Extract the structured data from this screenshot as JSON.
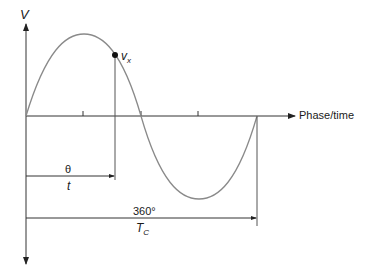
{
  "diagram": {
    "y_axis_label": "V",
    "x_axis_label": "Phase/time",
    "point_label": {
      "main": "v",
      "sub": "x"
    },
    "theta_label": "θ",
    "t_label": "t",
    "period_phase_label": "360°",
    "period_time_label": {
      "main": "T",
      "sub": "C"
    },
    "colors": {
      "curve": "#8a8a8a",
      "axis": "#333333",
      "point": "#111111",
      "background": "#ffffff"
    }
  }
}
